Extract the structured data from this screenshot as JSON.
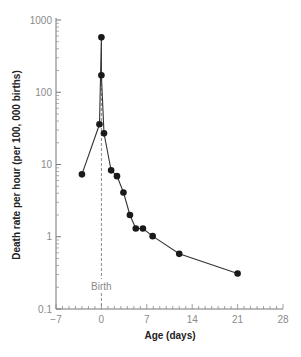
{
  "chart_data": {
    "type": "line",
    "title": "",
    "xlabel": "Age (days)",
    "ylabel": "Death rate per hour (per 100, 000 births)",
    "xlim": [
      -7,
      28
    ],
    "ylim": [
      0.1,
      1000
    ],
    "yscale": "log",
    "grid": false,
    "legend": "none",
    "x_ticks": [
      -7,
      0,
      7,
      14,
      21,
      28
    ],
    "x_tick_labels": [
      "-7",
      "0",
      "7",
      "14",
      "21",
      "28"
    ],
    "x_minor_step": 1,
    "y_ticks": [
      0.1,
      1,
      10,
      100,
      1000
    ],
    "y_tick_labels": [
      "0.1",
      "1",
      "10",
      "100",
      "1000"
    ],
    "annotations": [
      {
        "type": "vline",
        "x": 0,
        "style": "dashed",
        "label": "Birth"
      }
    ],
    "series": [
      {
        "name": "Death rate",
        "marker": "circle",
        "color": "#1a1a1a",
        "points": [
          {
            "x": -3,
            "y": 7.3
          },
          {
            "x": -0.3,
            "y": 36
          },
          {
            "x": 0,
            "y": 575
          },
          {
            "x": 0,
            "y": 172
          },
          {
            "x": 0.4,
            "y": 27
          },
          {
            "x": 1.5,
            "y": 8.3
          },
          {
            "x": 2.4,
            "y": 6.9
          },
          {
            "x": 3.4,
            "y": 4.1
          },
          {
            "x": 4.4,
            "y": 2.0
          },
          {
            "x": 5.3,
            "y": 1.3
          },
          {
            "x": 6.4,
            "y": 1.3
          },
          {
            "x": 7.9,
            "y": 1.02
          },
          {
            "x": 12,
            "y": 0.58
          },
          {
            "x": 21,
            "y": 0.31
          }
        ],
        "path_order": [
          0,
          1,
          2,
          3,
          4,
          5,
          6,
          7,
          8,
          9,
          10,
          11,
          12,
          13
        ]
      }
    ]
  }
}
